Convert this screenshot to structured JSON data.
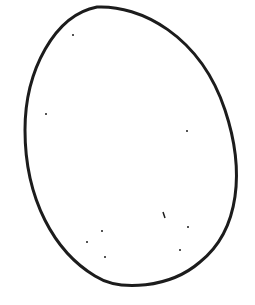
{
  "drawing": {
    "subject": "egg outline with speckles",
    "stroke_color": "#1c1c1c",
    "background_color": "#ffffff",
    "speck_count": 10
  }
}
